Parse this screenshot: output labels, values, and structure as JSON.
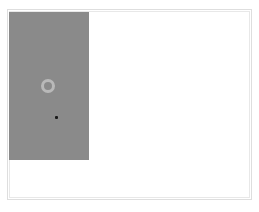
{
  "canvas": {
    "background": "#ffffff",
    "frame_border_color": "#dedede"
  },
  "panel": {
    "color": "#8a8a8a"
  },
  "ring": {
    "icon": "ring-icon",
    "color": "#b9b9b9"
  },
  "cursor": {
    "icon": "dot-cursor-icon",
    "color": "#1a1a1a"
  }
}
